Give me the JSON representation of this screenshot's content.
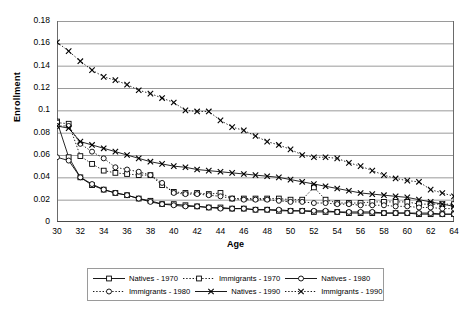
{
  "chart_data": {
    "type": "line",
    "title": "",
    "xlabel": "Age",
    "ylabel": "Enrollment",
    "xlim": [
      30,
      64
    ],
    "ylim": [
      0,
      0.18
    ],
    "ytick_step": 0.02,
    "xtick_step": 2,
    "grid": "horizontal",
    "legend_position": "bottom",
    "xticks": [
      "30",
      "32",
      "34",
      "36",
      "38",
      "40",
      "42",
      "44",
      "46",
      "48",
      "50",
      "52",
      "54",
      "56",
      "58",
      "60",
      "62",
      "64"
    ],
    "yticks": [
      "0",
      "0.02",
      "0.04",
      "0.06",
      "0.08",
      "0.1",
      "0.12",
      "0.14",
      "0.16",
      "0.18"
    ],
    "x": [
      30,
      31,
      32,
      33,
      34,
      35,
      36,
      37,
      38,
      39,
      40,
      41,
      42,
      43,
      44,
      45,
      46,
      47,
      48,
      49,
      50,
      51,
      52,
      53,
      54,
      55,
      56,
      57,
      58,
      59,
      60,
      61,
      62,
      63,
      64
    ],
    "series": [
      {
        "name": "Natives - 1970",
        "marker": "square",
        "line": "solid",
        "values": [
          0.09,
          0.058,
          0.04,
          0.033,
          0.029,
          0.026,
          0.024,
          0.021,
          0.019,
          0.016,
          0.016,
          0.015,
          0.014,
          0.013,
          0.013,
          0.012,
          0.012,
          0.011,
          0.011,
          0.01,
          0.01,
          0.01,
          0.009,
          0.009,
          0.009,
          0.008,
          0.008,
          0.008,
          0.008,
          0.008,
          0.008,
          0.007,
          0.007,
          0.007,
          0.007
        ]
      },
      {
        "name": "Immigrants - 1970",
        "marker": "square",
        "line": "dotted",
        "values": [
          0.089,
          0.088,
          0.059,
          0.052,
          0.046,
          0.044,
          0.043,
          0.042,
          0.042,
          0.033,
          0.027,
          0.026,
          0.026,
          0.025,
          0.026,
          0.021,
          0.021,
          0.021,
          0.021,
          0.021,
          0.02,
          0.02,
          0.031,
          0.02,
          0.017,
          0.017,
          0.017,
          0.018,
          0.018,
          0.018,
          0.018,
          0.016,
          0.016,
          0.016,
          0.016
        ]
      },
      {
        "name": "Natives - 1980",
        "marker": "circle",
        "line": "solid",
        "values": [
          0.058,
          0.055,
          0.04,
          0.034,
          0.029,
          0.026,
          0.024,
          0.021,
          0.018,
          0.016,
          0.015,
          0.014,
          0.014,
          0.013,
          0.012,
          0.012,
          0.012,
          0.011,
          0.011,
          0.011,
          0.01,
          0.01,
          0.01,
          0.01,
          0.009,
          0.009,
          0.009,
          0.009,
          0.008,
          0.008,
          0.008,
          0.008,
          0.008,
          0.007,
          0.007
        ]
      },
      {
        "name": "Immigrants - 1980",
        "marker": "circle",
        "line": "dotted",
        "values": [
          0.086,
          0.086,
          0.07,
          0.063,
          0.057,
          0.049,
          0.047,
          0.045,
          0.042,
          0.035,
          0.026,
          0.025,
          0.025,
          0.024,
          0.023,
          0.021,
          0.02,
          0.02,
          0.02,
          0.019,
          0.018,
          0.018,
          0.017,
          0.017,
          0.016,
          0.016,
          0.015,
          0.015,
          0.015,
          0.014,
          0.014,
          0.013,
          0.013,
          0.012,
          0.012
        ]
      },
      {
        "name": "Natives - 1990",
        "marker": "x",
        "line": "solid",
        "values": [
          0.086,
          0.084,
          0.072,
          0.069,
          0.066,
          0.063,
          0.06,
          0.057,
          0.054,
          0.052,
          0.05,
          0.049,
          0.047,
          0.046,
          0.045,
          0.044,
          0.043,
          0.042,
          0.041,
          0.04,
          0.038,
          0.036,
          0.034,
          0.032,
          0.03,
          0.028,
          0.026,
          0.025,
          0.024,
          0.023,
          0.022,
          0.02,
          0.018,
          0.016,
          0.014
        ]
      },
      {
        "name": "Immigrants - 1990",
        "marker": "x",
        "line": "dotted",
        "values": [
          0.161,
          0.153,
          0.144,
          0.136,
          0.13,
          0.127,
          0.123,
          0.118,
          0.115,
          0.111,
          0.107,
          0.1,
          0.099,
          0.099,
          0.091,
          0.085,
          0.082,
          0.077,
          0.072,
          0.069,
          0.065,
          0.06,
          0.058,
          0.058,
          0.057,
          0.053,
          0.05,
          0.046,
          0.042,
          0.039,
          0.037,
          0.036,
          0.029,
          0.026,
          0.023
        ]
      }
    ]
  },
  "legend": {
    "items": [
      {
        "label": "Natives - 1970"
      },
      {
        "label": "Immigrants - 1970"
      },
      {
        "label": "Natives - 1980"
      },
      {
        "label": "Immigrants - 1980"
      },
      {
        "label": "Natives - 1990"
      },
      {
        "label": "Immigrants - 1990"
      }
    ]
  },
  "colors": {
    "line": "#000000",
    "grid": "#808080",
    "axis": "#808080",
    "background": "#ffffff"
  }
}
